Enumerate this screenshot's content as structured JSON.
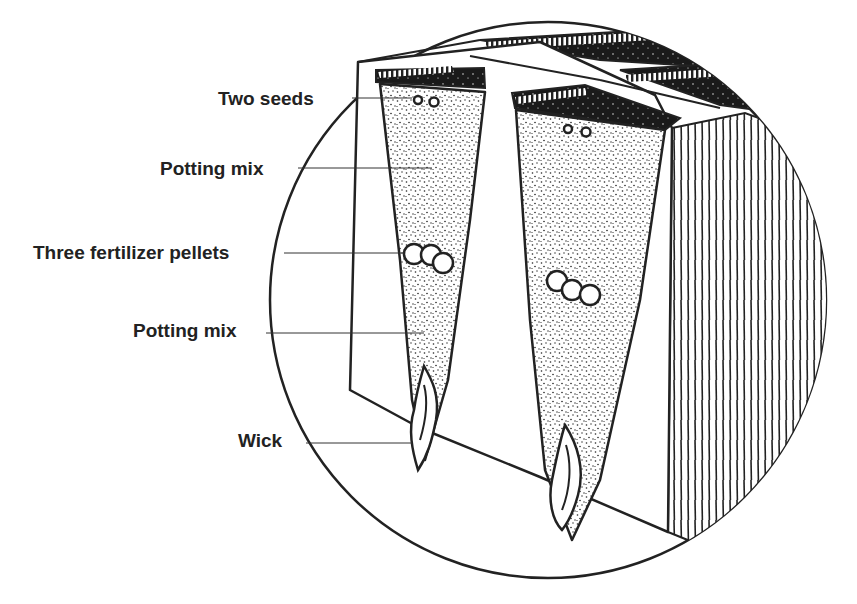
{
  "diagram": {
    "type": "cross-section illustration",
    "colors": {
      "ink": "#222222",
      "background": "#ffffff",
      "fill_dark": "#1a1a1a"
    },
    "labels": [
      {
        "id": "two-seeds",
        "text": "Two seeds",
        "x": 218,
        "y": 88
      },
      {
        "id": "potting-mix-top",
        "text": "Potting mix",
        "x": 160,
        "y": 158
      },
      {
        "id": "fertilizer-pellets",
        "text": "Three fertilizer pellets",
        "x": 33,
        "y": 242
      },
      {
        "id": "potting-mix-bottom",
        "text": "Potting mix",
        "x": 133,
        "y": 320
      },
      {
        "id": "wick",
        "text": "Wick",
        "x": 238,
        "y": 430
      }
    ],
    "components": [
      "circular-magnifier-outline",
      "tray-block",
      "left-cell",
      "right-cell",
      "seeds",
      "fertilizer-pellets",
      "wicks",
      "ribbed-side-face"
    ]
  }
}
